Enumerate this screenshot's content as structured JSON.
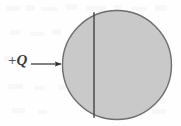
{
  "figure": {
    "name": "charged-sphere-diagram",
    "charge_label": {
      "sign": "+",
      "symbol": "Q",
      "full": "+Q"
    },
    "arrow": {
      "name": "charge-arrow",
      "direction": "right",
      "x_start": 31,
      "x_end": 62,
      "y": 64
    },
    "sphere": {
      "name": "gray-sphere",
      "center_x": 117,
      "center_y": 65,
      "radius": 55,
      "fill_color": "#c9c9c9",
      "stroke_color": "#6e6e6e"
    },
    "chord": {
      "name": "vertical-chord-line",
      "x": 94,
      "y_top": 12,
      "y_bottom": 118,
      "stroke_color": "#4a4a4a"
    },
    "background_color": "#fefeff"
  }
}
